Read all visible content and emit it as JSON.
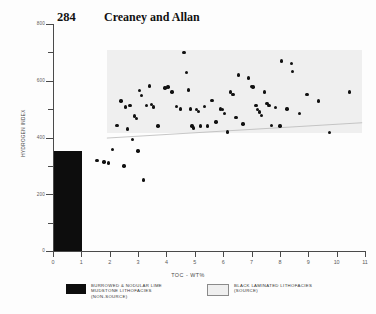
{
  "header": {
    "page_number": "284",
    "running_head": "Creaney and Allan"
  },
  "chart_data": {
    "type": "scatter",
    "title": "",
    "xlabel": "TOC - WT%",
    "ylabel": "HYDROGEN INDEX",
    "xlim": [
      0,
      11
    ],
    "ylim": [
      0,
      800
    ],
    "xticks": [
      0,
      1,
      2,
      3,
      4,
      5,
      6,
      7,
      8,
      9,
      10,
      11
    ],
    "yticks": [
      0,
      200,
      400,
      600,
      800
    ],
    "yticks_minor": [
      100,
      300,
      500,
      700
    ],
    "grid": false,
    "legend_position": "below-axes",
    "series": [
      {
        "name": "BLACK LAMINATED LITHOFACIES (SOURCE)",
        "marker": "filled-circle",
        "color": "#111111",
        "points": [
          [
            1.55,
            318
          ],
          [
            1.8,
            313
          ],
          [
            1.95,
            310
          ],
          [
            2.1,
            358
          ],
          [
            2.25,
            442
          ],
          [
            2.4,
            528
          ],
          [
            2.5,
            300
          ],
          [
            2.55,
            508
          ],
          [
            2.62,
            430
          ],
          [
            2.72,
            512
          ],
          [
            2.8,
            392
          ],
          [
            2.88,
            476
          ],
          [
            2.95,
            468
          ],
          [
            3.0,
            352
          ],
          [
            3.05,
            566
          ],
          [
            3.12,
            548
          ],
          [
            3.2,
            250
          ],
          [
            3.3,
            512
          ],
          [
            3.4,
            582
          ],
          [
            3.48,
            516
          ],
          [
            3.55,
            508
          ],
          [
            3.7,
            440
          ],
          [
            3.95,
            575
          ],
          [
            4.05,
            578
          ],
          [
            4.2,
            560
          ],
          [
            4.35,
            510
          ],
          [
            4.5,
            500
          ],
          [
            4.62,
            700
          ],
          [
            4.7,
            630
          ],
          [
            4.78,
            568
          ],
          [
            4.85,
            500
          ],
          [
            4.9,
            440
          ],
          [
            4.95,
            434
          ],
          [
            5.05,
            498
          ],
          [
            5.12,
            492
          ],
          [
            5.2,
            440
          ],
          [
            5.35,
            510
          ],
          [
            5.45,
            440
          ],
          [
            5.6,
            530
          ],
          [
            5.75,
            455
          ],
          [
            5.9,
            500
          ],
          [
            5.98,
            498
          ],
          [
            6.05,
            485
          ],
          [
            6.15,
            420
          ],
          [
            6.25,
            560
          ],
          [
            6.35,
            552
          ],
          [
            6.45,
            470
          ],
          [
            6.55,
            620
          ],
          [
            6.7,
            448
          ],
          [
            6.9,
            610
          ],
          [
            7.0,
            580
          ],
          [
            7.05,
            578
          ],
          [
            7.15,
            512
          ],
          [
            7.2,
            498
          ],
          [
            7.28,
            490
          ],
          [
            7.35,
            478
          ],
          [
            7.45,
            560
          ],
          [
            7.55,
            520
          ],
          [
            7.62,
            512
          ],
          [
            7.7,
            442
          ],
          [
            7.85,
            505
          ],
          [
            8.0,
            440
          ],
          [
            8.05,
            670
          ],
          [
            8.25,
            500
          ],
          [
            8.4,
            660
          ],
          [
            8.45,
            632
          ],
          [
            8.7,
            485
          ],
          [
            8.95,
            552
          ],
          [
            9.35,
            528
          ],
          [
            9.75,
            418
          ],
          [
            10.45,
            560
          ]
        ]
      },
      {
        "name": "BURROWED & NODULAR LIME MUDSTONE LITHOFACIES (NON-SOURCE)",
        "marker": "filled-rect",
        "color": "#0d0d0d",
        "region": {
          "x0": 0,
          "x1": 1.02,
          "y0": 0,
          "y1": 353
        }
      }
    ],
    "annotations": [
      {
        "name": "source-band",
        "label": "BLACK LAMINATED LITHOFACIES (SOURCE)",
        "fill": "#efefef",
        "x0": 1.9,
        "x1": 10.9,
        "y_top": 710,
        "y_bottom_left": 415,
        "y_bottom_right": 415
      },
      {
        "name": "trend-line",
        "x0": 1.9,
        "y0": 398,
        "x1": 10.9,
        "y1": 452
      }
    ]
  },
  "legend": {
    "items": [
      {
        "swatch": "black-fill",
        "text": "BURROWED & NODULAR LIME\nMUDSTONE LITHOFACIES\n(NON-SOURCE)"
      },
      {
        "swatch": "grey-fill",
        "text": "BLACK LAMINATED LITHOFACIES\n(SOURCE)"
      }
    ]
  },
  "colors": {
    "point": "#111111",
    "bar": "#0d0d0d",
    "band": "#efefef",
    "axis": "#4a4a4a",
    "background": "#fdfdfd"
  }
}
